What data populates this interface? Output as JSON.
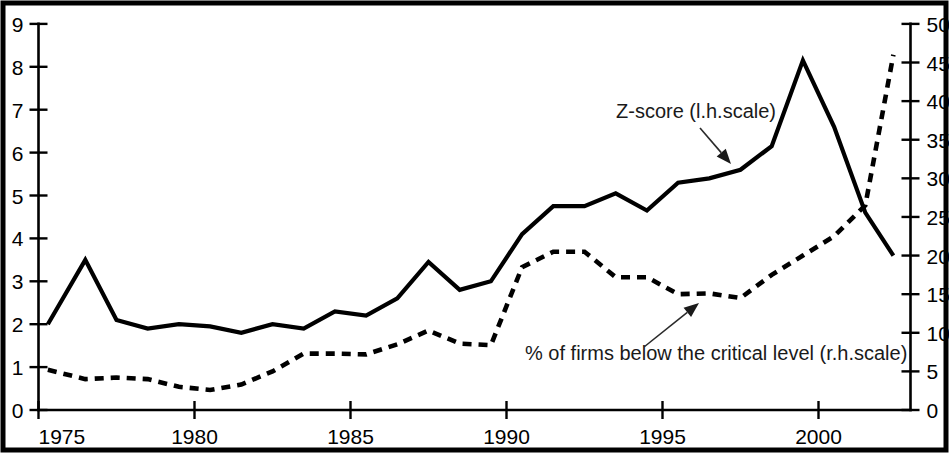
{
  "chart_data": {
    "type": "line",
    "title": "",
    "xlabel": "",
    "ylabel": "",
    "grid": false,
    "legend_position": "inline-annotations",
    "x_axis": {
      "min": 1975,
      "max": 2003,
      "tick_labels": [
        "1975",
        "1980",
        "1985",
        "1990",
        "1995",
        "2000"
      ],
      "tick_values": [
        1975,
        1980,
        1985,
        1990,
        1995,
        2000
      ]
    },
    "y_axis_left": {
      "label": "Z-score (l.h.scale)",
      "min": 0,
      "max": 9,
      "tick_labels": [
        "0",
        "1",
        "2",
        "3",
        "4",
        "5",
        "6",
        "7",
        "8",
        "9"
      ],
      "tick_values": [
        0,
        1,
        2,
        3,
        4,
        5,
        6,
        7,
        8,
        9
      ]
    },
    "y_axis_right": {
      "label": "% of firms below the critical level (r.h.scale)",
      "min": 0,
      "max": 50,
      "tick_labels": [
        "0",
        "5",
        "10",
        "15",
        "20",
        "25",
        "30",
        "35",
        "40",
        "45",
        "50"
      ],
      "tick_values": [
        0,
        5,
        10,
        15,
        20,
        25,
        30,
        35,
        40,
        45,
        50
      ]
    },
    "series": [
      {
        "name": "Z-score (l.h.scale)",
        "axis": "left",
        "style": "solid",
        "x": [
          1975.3,
          1976.5,
          1977.5,
          1978.5,
          1979.5,
          1980.5,
          1981.5,
          1982.5,
          1983.5,
          1984.5,
          1985.5,
          1986.5,
          1987.5,
          1988.5,
          1989.5,
          1990.5,
          1991.5,
          1992.5,
          1993.5,
          1994.5,
          1995.5,
          1996.5,
          1997.5,
          1998.5,
          1999.5,
          2000.5,
          2001.5,
          2002.4
        ],
        "values": [
          2.0,
          3.5,
          2.1,
          1.9,
          2.0,
          1.95,
          1.8,
          2.0,
          1.9,
          2.3,
          2.2,
          2.6,
          3.45,
          2.8,
          3.0,
          4.1,
          4.75,
          4.75,
          5.05,
          4.65,
          5.3,
          5.4,
          5.6,
          6.15,
          8.15,
          6.6,
          4.6,
          3.6
        ]
      },
      {
        "name": "% of firms below the critical level (r.h.scale)",
        "axis": "right",
        "style": "dashed",
        "x": [
          1975.3,
          1976.5,
          1977.5,
          1978.5,
          1979.5,
          1980.5,
          1981.5,
          1982.5,
          1983.5,
          1984.5,
          1985.5,
          1986.5,
          1987.5,
          1988.5,
          1989.5,
          1990.5,
          1991.5,
          1992.5,
          1993.5,
          1994.5,
          1995.5,
          1996.5,
          1997.5,
          1998.5,
          1999.5,
          2000.5,
          2001.5,
          2002.4
        ],
        "values": [
          5.2,
          4.0,
          4.2,
          4.0,
          3.0,
          2.6,
          3.3,
          5.0,
          7.3,
          7.3,
          7.2,
          8.5,
          10.3,
          8.6,
          8.4,
          18.5,
          20.5,
          20.5,
          17.2,
          17.2,
          15.0,
          15.1,
          14.5,
          17.5,
          20.0,
          22.5,
          26.5,
          46.0
        ]
      }
    ],
    "annotations": [
      {
        "text": "Z-score (l.h.scale)",
        "text_x": 616,
        "text_y": 118,
        "arrow_from_x": 700,
        "arrow_from_y": 128,
        "arrow_to_x": 731,
        "arrow_to_y": 164
      },
      {
        "text": "% of firms below the critical level (r.h.scale)",
        "text_x": 525,
        "text_y": 360,
        "arrow_from_x": 644,
        "arrow_from_y": 347,
        "arrow_to_x": 699,
        "arrow_to_y": 303
      }
    ],
    "colors": {
      "line": "#000000",
      "text": "#000000",
      "background": "#ffffff"
    }
  },
  "figure": {
    "frame_visible": true
  }
}
